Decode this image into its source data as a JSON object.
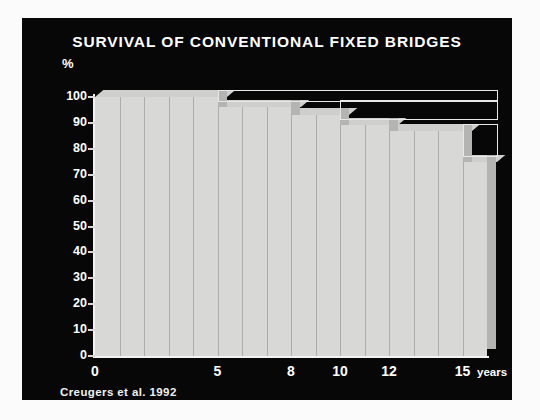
{
  "figure": {
    "title": "SURVIVAL OF CONVENTIONAL FIXED BRIDGES",
    "caption": "Creugers et al. 1992",
    "y_axis_unit": "%",
    "x_axis_unit": "years",
    "background_color": "#070707",
    "bar_color": "#d8d8d6",
    "text_color": "#ffffff"
  },
  "chart_data": {
    "type": "area",
    "title": "SURVIVAL OF CONVENTIONAL FIXED BRIDGES",
    "subtitle": "Creugers et al. 1992",
    "xlabel": "years",
    "ylabel": "%",
    "xlim": [
      0,
      16
    ],
    "ylim": [
      0,
      100
    ],
    "grid": true,
    "legend": "none",
    "style": "3d stepped survival curve (Kaplan-Meier)",
    "y_ticks": [
      0,
      10,
      20,
      30,
      40,
      50,
      60,
      70,
      80,
      90,
      100
    ],
    "x_ticks": [
      0,
      5,
      8,
      10,
      12,
      15
    ],
    "x_tick_labels": [
      "0",
      "5",
      "8",
      "10",
      "12",
      "15"
    ],
    "x": [
      0,
      1,
      2,
      3,
      4,
      5,
      6,
      7,
      8,
      9,
      10,
      11,
      12,
      13,
      14,
      15,
      16
    ],
    "values": [
      100,
      100,
      100,
      100,
      100,
      96,
      96,
      96,
      93,
      93,
      89,
      89,
      87,
      87,
      87,
      75,
      75
    ],
    "steps": [
      {
        "from_year": 0,
        "to_year": 5,
        "survival": 100
      },
      {
        "from_year": 5,
        "to_year": 8,
        "survival": 96
      },
      {
        "from_year": 8,
        "to_year": 10,
        "survival": 93
      },
      {
        "from_year": 10,
        "to_year": 12,
        "survival": 89
      },
      {
        "from_year": 12,
        "to_year": 15,
        "survival": 87
      },
      {
        "from_year": 15,
        "to_year": 16,
        "survival": 75
      }
    ],
    "annotations": []
  }
}
